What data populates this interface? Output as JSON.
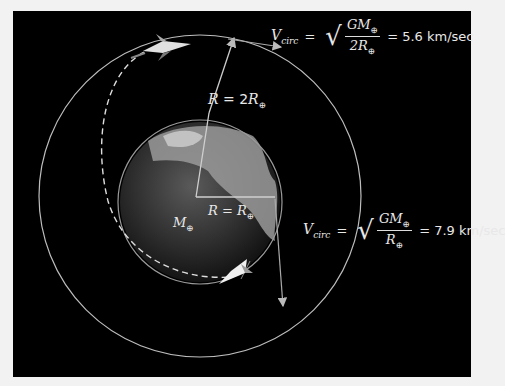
{
  "figure": {
    "background": "#000000",
    "orbit_color": "#bdbdbd",
    "outer_orbit": {
      "label": "R = 2R⊕",
      "R": "R",
      "eq": "=",
      "coef": "2",
      "sym": "R",
      "sub": "⊕"
    },
    "inner_orbit": {
      "label": "R = R⊕",
      "R": "R",
      "eq": "=",
      "sym": "R",
      "sub": "⊕"
    },
    "earth_mass_label": {
      "sym": "M",
      "sub": "⊕"
    },
    "equation_outer": {
      "lhs": "V",
      "lhs_sub": "circ",
      "equals": "=",
      "numerator": "GM",
      "numerator_sub": "⊕",
      "denominator": "2R",
      "denominator_sub": "⊕",
      "result": "= 5.6 km/sec"
    },
    "equation_inner": {
      "lhs": "V",
      "lhs_sub": "circ",
      "equals": "=",
      "numerator": "GM",
      "numerator_sub": "⊕",
      "denominator": "R",
      "denominator_sub": "⊕",
      "result": "= 7.9 km/sec"
    }
  }
}
